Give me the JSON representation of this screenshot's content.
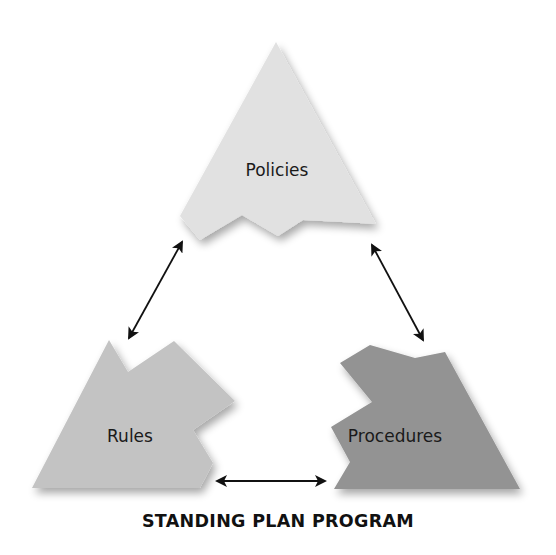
{
  "diagram": {
    "title": "STANDING PLAN PROGRAM",
    "nodes": [
      {
        "id": "policies",
        "label": "Policies",
        "color": "#e1e1e1"
      },
      {
        "id": "rules",
        "label": "Rules",
        "color": "#c3c3c3"
      },
      {
        "id": "procedures",
        "label": "Procedures",
        "color": "#939393"
      }
    ],
    "edges": [
      {
        "from": "policies",
        "to": "rules",
        "type": "bidirectional-arrow"
      },
      {
        "from": "policies",
        "to": "procedures",
        "type": "bidirectional-arrow"
      },
      {
        "from": "rules",
        "to": "procedures",
        "type": "bidirectional-arrow"
      }
    ]
  }
}
